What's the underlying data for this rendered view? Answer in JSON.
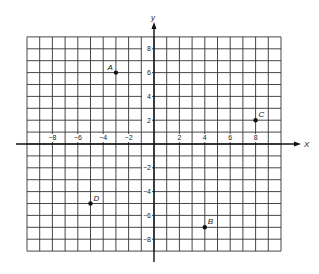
{
  "chart_data": {
    "type": "scatter",
    "title": "",
    "xlabel": "X",
    "ylabel": "Y",
    "xlim": [
      -10,
      10
    ],
    "ylim": [
      -9,
      9
    ],
    "grid": true,
    "x_ticks": [
      -8,
      -6,
      -4,
      -2,
      2,
      4,
      6,
      8
    ],
    "y_ticks": [
      8,
      6,
      4,
      2,
      -2,
      -4,
      -6,
      -8
    ],
    "points": [
      {
        "label": "A",
        "x": -3,
        "y": 6
      },
      {
        "label": "B",
        "x": 4,
        "y": -7
      },
      {
        "label": "C",
        "x": 8,
        "y": 2
      },
      {
        "label": "D",
        "x": -5,
        "y": -5
      }
    ]
  },
  "axes": {
    "x_label": "X",
    "y_label": "Y"
  },
  "colors": {
    "grid": "#333333",
    "axis": "#111111",
    "point": "#111111"
  }
}
